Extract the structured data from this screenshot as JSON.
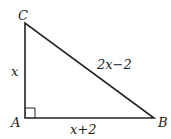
{
  "diagram": {
    "type": "right-triangle",
    "vertices": [
      {
        "name": "C",
        "x": 25,
        "y": 23
      },
      {
        "name": "A",
        "x": 25,
        "y": 118
      },
      {
        "name": "B",
        "x": 154,
        "y": 118
      }
    ],
    "right_angle_at": "A",
    "sides": {
      "AC": "x",
      "AB": "x+2",
      "BC": "2x−2"
    },
    "labels": {
      "C": "C",
      "A": "A",
      "B": "B"
    },
    "colors": {
      "stroke": "#222222",
      "background": "#ffffff"
    }
  }
}
